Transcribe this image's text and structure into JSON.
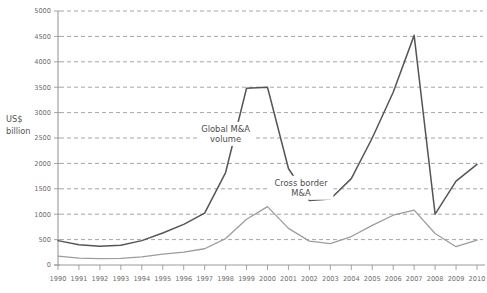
{
  "chart_data": {
    "type": "line",
    "title": "",
    "xlabel": "",
    "ylabel": "US$ billion",
    "ylabel_line1": "US$",
    "ylabel_line2": "billion",
    "ylim": [
      0,
      5000
    ],
    "ytick_step": 500,
    "yticks": [
      0,
      500,
      1000,
      1500,
      2000,
      2500,
      3000,
      3500,
      4000,
      4500,
      5000
    ],
    "ytick_labels": [
      "0",
      "500",
      "1000",
      "1500",
      "2000",
      "2500",
      "3000",
      "3500",
      "4000",
      "4500",
      "5000"
    ],
    "grid": true,
    "grid_axis": "y",
    "legend_position": "inline-annotation",
    "x": [
      1990,
      1991,
      1992,
      1993,
      1994,
      1995,
      1996,
      1997,
      1998,
      1999,
      2000,
      2001,
      2002,
      2003,
      2004,
      2005,
      2006,
      2007,
      2008,
      2009,
      2010
    ],
    "categories": [
      "1990",
      "1991",
      "1992",
      "1993",
      "1994",
      "1995",
      "1996",
      "1997",
      "1998",
      "1999",
      "2000",
      "2001",
      "2002",
      "2003",
      "2004",
      "2005",
      "2006",
      "2007",
      "2008",
      "2009",
      "2010"
    ],
    "series": [
      {
        "name": "Global M&A volume",
        "color": "#555555",
        "width": 1.5,
        "values": [
          480,
          400,
          370,
          390,
          480,
          630,
          800,
          1020,
          1820,
          3480,
          3500,
          1900,
          1270,
          1300,
          1700,
          2500,
          3400,
          4520,
          1000,
          1650,
          1980
        ]
      },
      {
        "name": "Cross border M&A",
        "color": "#9d9d9d",
        "width": 1.3,
        "values": [
          175,
          135,
          125,
          130,
          160,
          215,
          255,
          320,
          520,
          900,
          1150,
          720,
          470,
          420,
          560,
          780,
          980,
          1080,
          620,
          360,
          490
        ]
      }
    ],
    "annotations": [
      {
        "text_line1": "Global M&A",
        "text_line2": "volume",
        "x": 1998,
        "y": 2620
      },
      {
        "text_line1": "Cross border",
        "text_line2": "M&A",
        "x": 2001.6,
        "y": 1560
      }
    ]
  }
}
